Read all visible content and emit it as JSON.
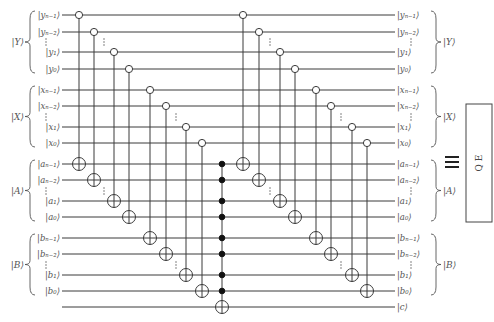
{
  "diagram": {
    "wire_x_start": 62,
    "wire_x_end": 395,
    "wires": [
      {
        "id": "y_n-1",
        "y": 15,
        "left": "|yₙ₋₁⟩",
        "right": "|yₙ₋₁⟩"
      },
      {
        "id": "y_n-2",
        "y": 32,
        "left": "|yₙ₋₂⟩",
        "right": "|yₙ₋₂⟩"
      },
      {
        "id": "y_1",
        "y": 52,
        "left": "|y₁⟩",
        "right": "|y₁⟩"
      },
      {
        "id": "y_0",
        "y": 69,
        "left": "|y₀⟩",
        "right": "|y₀⟩"
      },
      {
        "id": "x_n-1",
        "y": 90,
        "left": "|xₙ₋₁⟩",
        "right": "|xₙ₋₁⟩"
      },
      {
        "id": "x_n-2",
        "y": 106,
        "left": "|xₙ₋₂⟩",
        "right": "|xₙ₋₂⟩"
      },
      {
        "id": "x_1",
        "y": 127,
        "left": "|x₁⟩",
        "right": "|x₁⟩"
      },
      {
        "id": "x_0",
        "y": 143,
        "left": "|x₀⟩",
        "right": "|x₀⟩"
      },
      {
        "id": "a_n-1",
        "y": 164,
        "left": "|aₙ₋₁⟩",
        "right": "|aₙ₋₁⟩"
      },
      {
        "id": "a_n-2",
        "y": 180,
        "left": "|aₙ₋₂⟩",
        "right": "|aₙ₋₂⟩"
      },
      {
        "id": "a_1",
        "y": 201,
        "left": "|a₁⟩",
        "right": "|a₁⟩"
      },
      {
        "id": "a_0",
        "y": 217,
        "left": "|a₀⟩",
        "right": "|a₀⟩"
      },
      {
        "id": "b_n-1",
        "y": 238,
        "left": "|bₙ₋₁⟩",
        "right": "|bₙ₋₁⟩"
      },
      {
        "id": "b_n-2",
        "y": 254,
        "left": "|bₙ₋₂⟩",
        "right": "|bₙ₋₂⟩"
      },
      {
        "id": "b_1",
        "y": 275,
        "left": "|b₁⟩",
        "right": "|b₁⟩"
      },
      {
        "id": "b_0",
        "y": 291,
        "left": "|b₀⟩",
        "right": "|b₀⟩"
      },
      {
        "id": "c",
        "y": 307,
        "left": "",
        "right": "|c⟩"
      }
    ],
    "registers": [
      {
        "label": "|Y⟩",
        "top": 15,
        "bottom": 69,
        "dots_y": 42
      },
      {
        "label": "|X⟩",
        "top": 90,
        "bottom": 143,
        "dots_y": 117
      },
      {
        "label": "|A⟩",
        "top": 164,
        "bottom": 217,
        "dots_y": 191
      },
      {
        "label": "|B⟩",
        "top": 238,
        "bottom": 291,
        "dots_y": 265
      }
    ],
    "cnots": [
      {
        "x": 79,
        "control": 15,
        "target": 164
      },
      {
        "x": 94,
        "control": 32,
        "target": 180
      },
      {
        "x": 114,
        "control": 52,
        "target": 201
      },
      {
        "x": 129,
        "control": 69,
        "target": 217
      },
      {
        "x": 150,
        "control": 90,
        "target": 238
      },
      {
        "x": 166,
        "control": 106,
        "target": 254
      },
      {
        "x": 186,
        "control": 127,
        "target": 275
      },
      {
        "x": 202,
        "control": 143,
        "target": 291
      },
      {
        "x": 243,
        "control": 15,
        "target": 164
      },
      {
        "x": 259,
        "control": 32,
        "target": 180
      },
      {
        "x": 280,
        "control": 52,
        "target": 201
      },
      {
        "x": 295,
        "control": 69,
        "target": 217
      },
      {
        "x": 316,
        "control": 90,
        "target": 238
      },
      {
        "x": 331,
        "control": 106,
        "target": 254
      },
      {
        "x": 352,
        "control": 127,
        "target": 275
      },
      {
        "x": 367,
        "control": 143,
        "target": 291
      }
    ],
    "gate_dots": [
      {
        "x": 104,
        "y": 191
      },
      {
        "x": 176,
        "y": 265
      },
      {
        "x": 270,
        "y": 191
      },
      {
        "x": 341,
        "y": 265
      },
      {
        "x": 104,
        "y": 42
      },
      {
        "x": 176,
        "y": 117
      },
      {
        "x": 270,
        "y": 42
      },
      {
        "x": 341,
        "y": 117
      }
    ],
    "toffoli": {
      "x": 222,
      "controls": [
        164,
        180,
        201,
        217,
        238,
        254,
        275,
        291
      ],
      "target": 307
    },
    "equivalence_symbol": "≡",
    "equiv_pos": {
      "x": 452,
      "y": 162
    },
    "qe_block": {
      "label": "Q E",
      "x": 466,
      "y": 104,
      "w": 26,
      "h": 118
    }
  }
}
